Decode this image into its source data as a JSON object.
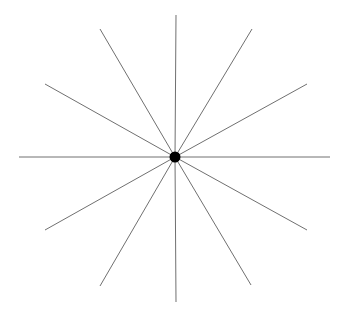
{
  "diagram": {
    "type": "radial-star",
    "background": "#ffffff",
    "line_color": "#707070",
    "line_width": 1,
    "center": {
      "x": 175,
      "y": 157
    },
    "center_dot": {
      "radius": 5.5,
      "color": "#000000"
    },
    "rays": [
      {
        "angle": 0,
        "end": {
          "x": 330,
          "y": 157
        }
      },
      {
        "angle": 30,
        "end": {
          "x": 307,
          "y": 84
        }
      },
      {
        "angle": 60,
        "end": {
          "x": 252,
          "y": 29
        }
      },
      {
        "angle": 90,
        "end": {
          "x": 176,
          "y": 15
        }
      },
      {
        "angle": 120,
        "end": {
          "x": 100,
          "y": 29
        }
      },
      {
        "angle": 150,
        "end": {
          "x": 45,
          "y": 84
        }
      },
      {
        "angle": 180,
        "end": {
          "x": 19,
          "y": 157
        }
      },
      {
        "angle": 210,
        "end": {
          "x": 45,
          "y": 230
        }
      },
      {
        "angle": 240,
        "end": {
          "x": 100,
          "y": 286
        }
      },
      {
        "angle": 270,
        "end": {
          "x": 176,
          "y": 302
        }
      },
      {
        "angle": 300,
        "end": {
          "x": 251,
          "y": 285
        }
      },
      {
        "angle": 330,
        "end": {
          "x": 307,
          "y": 230
        }
      }
    ]
  }
}
